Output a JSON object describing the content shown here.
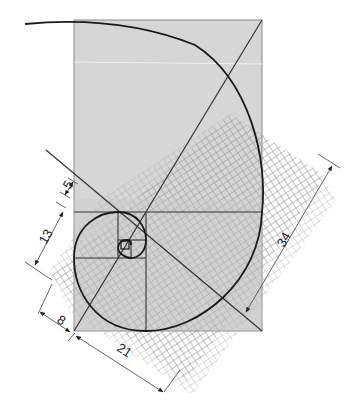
{
  "diagram": {
    "type": "golden-spiral-construction",
    "dimension_labels": {
      "d5": "5",
      "d13": "13",
      "d8": "8",
      "d21": "21",
      "d34": "34"
    },
    "colors": {
      "rect_fill": "#d6d6d6",
      "rect_stroke": "#8a8a8a",
      "grid_stroke": "#9a9a9a",
      "spiral_stroke": "#1a1a1a",
      "line_stroke": "#333333",
      "dim_stroke": "#555555"
    },
    "fibonacci_sequence": [
      1,
      1,
      2,
      3,
      5,
      8,
      13,
      21,
      34
    ]
  }
}
